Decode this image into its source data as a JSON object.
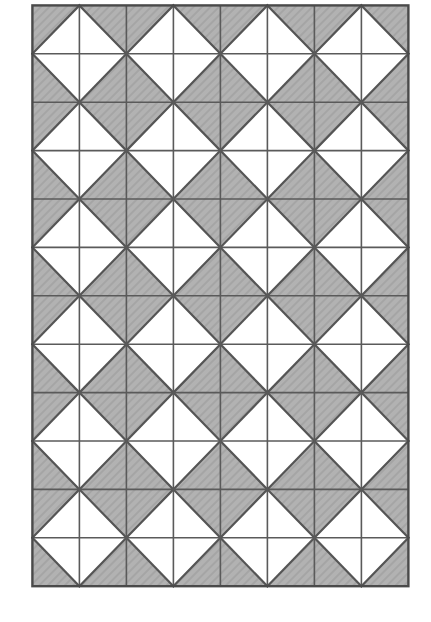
{
  "figure": {
    "background_color": "#ffffff"
  },
  "canvas": {
    "width": 431,
    "height": 622
  },
  "pattern": {
    "origin_x": 32,
    "origin_y": 5,
    "cell_width": 47,
    "cell_height": 48.4,
    "columns": 8,
    "rows": 12,
    "fill_color": "#b2b2b2",
    "white_color": "#ffffff",
    "line_color": "#555555",
    "grid_line_color": "#5a5a5a",
    "border_color": "#4a4a4a",
    "line_width": 2.2,
    "grid_line_width": 1.6,
    "border_width": 2.4,
    "motif": "half-square-triangle",
    "hatch_opacity": 0.07,
    "legend_note": "Each cell code is the corner occupied by the white triangle: tl = top-left, tr = top-right, bl = bottom-left, br = bottom-right.",
    "cells": [
      [
        "br",
        "bl",
        "br",
        "bl",
        "br",
        "bl",
        "br",
        "bl"
      ],
      [
        "tr",
        "tl",
        "tr",
        "tl",
        "tr",
        "tl",
        "tr",
        "tl"
      ],
      [
        "br",
        "bl",
        "br",
        "bl",
        "br",
        "bl",
        "br",
        "bl"
      ],
      [
        "tr",
        "tl",
        "tr",
        "tl",
        "tr",
        "tl",
        "tr",
        "tl"
      ],
      [
        "br",
        "bl",
        "br",
        "bl",
        "br",
        "bl",
        "br",
        "bl"
      ],
      [
        "tr",
        "tl",
        "tr",
        "tl",
        "tr",
        "tl",
        "tr",
        "tl"
      ],
      [
        "br",
        "bl",
        "br",
        "bl",
        "br",
        "bl",
        "br",
        "bl"
      ],
      [
        "tr",
        "tl",
        "tr",
        "tl",
        "tr",
        "tl",
        "tr",
        "tl"
      ],
      [
        "br",
        "bl",
        "br",
        "bl",
        "br",
        "bl",
        "br",
        "bl"
      ],
      [
        "tr",
        "tl",
        "tr",
        "tl",
        "tr",
        "tl",
        "tr",
        "tl"
      ],
      [
        "br",
        "bl",
        "br",
        "bl",
        "br",
        "bl",
        "br",
        "bl"
      ],
      [
        "tr",
        "tl",
        "tr",
        "tl",
        "tr",
        "tl",
        "tr",
        "tl"
      ]
    ]
  }
}
